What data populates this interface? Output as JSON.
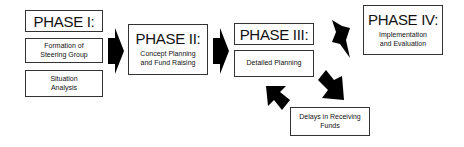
{
  "phases": [
    {
      "title": "PHASE I:",
      "items": [
        "Formation of Steering Group",
        "Situation Analysis"
      ]
    },
    {
      "title": "PHASE II:",
      "description": "Concept Planning and Fund Raising"
    },
    {
      "title": "PHASE III:",
      "items": [
        "Detailed Planning"
      ]
    },
    {
      "title": "PHASE IV:",
      "description": "Implementation and Evaluation"
    }
  ],
  "side_box": {
    "label": "Delays in Receiving Funds"
  },
  "colors": {
    "arrow": "#000000",
    "border": "#333333"
  }
}
